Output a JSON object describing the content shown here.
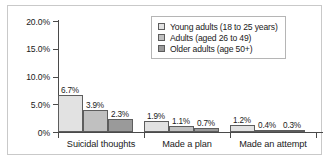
{
  "chart_data": {
    "type": "bar",
    "title": "",
    "subtitle": "",
    "xlabel": "",
    "ylabel": "",
    "categories": [
      "Suicidal thoughts",
      "Made a plan",
      "Made an attempt"
    ],
    "series": [
      {
        "name": "Young adults (18 to 25 years)",
        "color": "#e2e2e2",
        "values": [
          6.7,
          1.9,
          1.2
        ],
        "labels": [
          "6.7%",
          "1.9%",
          "1.2%"
        ]
      },
      {
        "name": "Adults (aged 26 to 49)",
        "color": "#c0c0c0",
        "values": [
          3.9,
          1.1,
          0.4
        ],
        "labels": [
          "3.9%",
          "1.1%",
          "0.4%"
        ]
      },
      {
        "name": "Older adults (age 50+)",
        "color": "#9a9a9a",
        "values": [
          2.3,
          0.7,
          0.3
        ],
        "labels": [
          "2.3%",
          "0.7%",
          "0.3%"
        ]
      }
    ],
    "ylim": [
      0,
      20
    ],
    "ytick_values": [
      20,
      15,
      10,
      5,
      0
    ],
    "ytick_labels": [
      "20.0%",
      "15.0%",
      "10.0%",
      "5.0%",
      "0%"
    ],
    "grid": false,
    "legend_position": "top-right",
    "bar_border_color": "#5d5d5d",
    "axis_color": "#4a4a4a",
    "frame_color": "#c9c9c9",
    "background": "#ffffff"
  }
}
